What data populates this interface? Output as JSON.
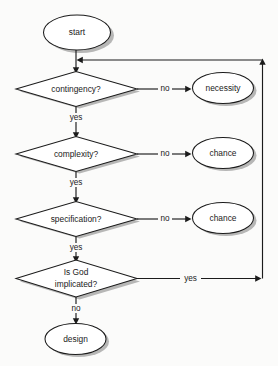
{
  "diagram": {
    "background_color": "#fbfbfa",
    "line_color": "#1b1b1b",
    "shadow_color": "#8d8d8d",
    "shape_fill": "#ffffff",
    "nodes": [
      {
        "id": "start",
        "type": "terminator",
        "label": "start"
      },
      {
        "id": "contingency",
        "type": "decision",
        "label": "contingency?"
      },
      {
        "id": "necessity",
        "type": "terminator",
        "label": "necessity"
      },
      {
        "id": "complexity",
        "type": "decision",
        "label": "complexity?"
      },
      {
        "id": "chance1",
        "type": "terminator",
        "label": "chance"
      },
      {
        "id": "specification",
        "type": "decision",
        "label": "specification?"
      },
      {
        "id": "chance2",
        "type": "terminator",
        "label": "chance"
      },
      {
        "id": "isgod",
        "type": "decision",
        "label_line1": "Is God",
        "label_line2": "implicated?"
      },
      {
        "id": "design",
        "type": "terminator",
        "label": "design"
      }
    ],
    "edge_labels": {
      "contingency_no": "no",
      "contingency_yes": "yes",
      "complexity_no": "no",
      "complexity_yes": "yes",
      "specification_no": "no",
      "specification_yes": "yes",
      "isgod_yes": "yes",
      "isgod_no": "no"
    }
  }
}
